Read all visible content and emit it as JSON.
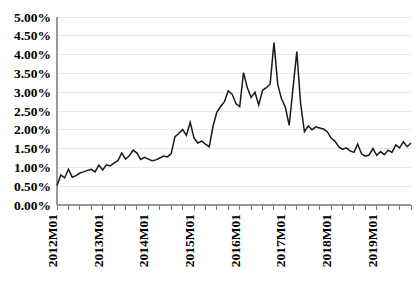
{
  "chart_data": {
    "type": "line",
    "title": "",
    "subtitle": "",
    "xlabel": "",
    "ylabel": "",
    "grid": true,
    "legend": false,
    "legend_position": "none",
    "line_color": "#1a1a1a",
    "gridline_color": "#e9e9e9",
    "axis_color": "#9a9a9a",
    "ylim": [
      0,
      5
    ],
    "y_tick_labels": [
      "0.00%",
      "0.50%",
      "1.00%",
      "1.50%",
      "2.00%",
      "2.50%",
      "3.00%",
      "3.50%",
      "4.00%",
      "4.50%",
      "5.00%"
    ],
    "y_tick_values": [
      0,
      0.5,
      1.0,
      1.5,
      2.0,
      2.5,
      3.0,
      3.5,
      4.0,
      4.5,
      5.0
    ],
    "y_unit": "%",
    "x_tick_labels": [
      "2012M01",
      "2013M01",
      "2014M01",
      "2015M01",
      "2016M01",
      "2017M01",
      "2018M01",
      "2019M01"
    ],
    "x_tick_indices": [
      0,
      12,
      24,
      36,
      48,
      60,
      72,
      84
    ],
    "x_minor_tick_interval_months": 3,
    "x_start": "2012M01",
    "x_end": "2019M06",
    "n_points": 90,
    "series": [
      {
        "name": "rate",
        "values": [
          0.52,
          0.8,
          0.72,
          0.95,
          0.74,
          0.78,
          0.85,
          0.88,
          0.92,
          0.95,
          0.88,
          1.06,
          0.93,
          1.07,
          1.04,
          1.12,
          1.18,
          1.38,
          1.22,
          1.31,
          1.46,
          1.38,
          1.21,
          1.27,
          1.22,
          1.18,
          1.2,
          1.25,
          1.3,
          1.28,
          1.37,
          1.82,
          1.9,
          2.01,
          1.85,
          2.2,
          1.78,
          1.65,
          1.7,
          1.62,
          1.55,
          2.1,
          2.47,
          2.62,
          2.75,
          3.04,
          2.95,
          2.7,
          2.62,
          3.52,
          3.12,
          2.86,
          3.0,
          2.66,
          3.05,
          3.12,
          3.22,
          4.32,
          3.2,
          2.82,
          2.6,
          2.12,
          3.1,
          4.08,
          2.7,
          1.95,
          2.1,
          2.0,
          2.08,
          2.05,
          2.02,
          1.95,
          1.78,
          1.7,
          1.55,
          1.48,
          1.52,
          1.44,
          1.4,
          1.62,
          1.36,
          1.3,
          1.33,
          1.5,
          1.32,
          1.42,
          1.34,
          1.46,
          1.4,
          1.6,
          1.52,
          1.68,
          1.55,
          1.65
        ]
      }
    ],
    "notes": {
      "max_value": 4.32,
      "max_label": "2015M11",
      "second_peak_value": 4.08,
      "second_peak_label": "2016M04",
      "min_value": 0.52,
      "min_label": "2012M01",
      "end_value": 1.65
    }
  },
  "plot_geometry": {
    "left": 57,
    "right": 411,
    "top": 17,
    "bottom": 205
  }
}
